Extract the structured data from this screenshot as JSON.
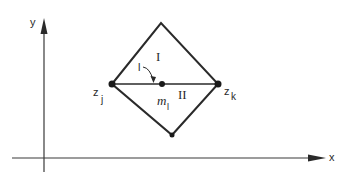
{
  "diagram": {
    "axes": {
      "x_label": "x",
      "y_label": "y"
    },
    "nodes": {
      "left": {
        "label": "z",
        "sub": "j"
      },
      "right": {
        "label": "z",
        "sub": "k"
      },
      "top": {
        "label": ""
      },
      "bottom": {
        "label": ""
      },
      "mid": {
        "label": "m",
        "sub": "l"
      }
    },
    "regions": {
      "upper": "I",
      "lower": "II"
    },
    "edge_label": "l",
    "colors": {
      "stroke": "#2a2a2a",
      "background": "#ffffff"
    }
  }
}
